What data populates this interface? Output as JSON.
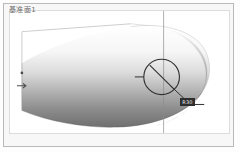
{
  "viewport": {
    "background_color": "#ffffff",
    "frame_color": "#b9b9b9",
    "panel_color": "#ffffff"
  },
  "datum": {
    "caption": "基准面1",
    "caption_color": "#6b6b6b"
  },
  "model": {
    "name": "revolved-dome-solid",
    "shading": "vertical-gradient",
    "highlight_color": "#fdfdfd",
    "midtone_color": "#c9c9c9",
    "shadow_color": "#6e6e6e",
    "outline_color": "#4a4a4a"
  },
  "annotations": {
    "centerline_color": "#8c8c8c",
    "wireframe_color": "#c2c2c2",
    "plane_symbol_name": "slashed-circle-plane-symbol",
    "plane_symbol_color": "#2f2f2f",
    "leader_color": "#2f2f2f",
    "dimension_label": "R30",
    "dimension_text_color": "#ededed",
    "dimension_chip_color": "#2e2e2e",
    "left_marker_color": "#4d4d4d"
  }
}
